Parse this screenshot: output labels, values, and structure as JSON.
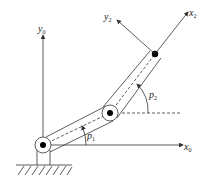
{
  "diagram": {
    "type": "two-link planar robot arm",
    "labels": {
      "y0": {
        "base": "y",
        "sub": "0"
      },
      "x0": {
        "base": "x",
        "sub": "0"
      },
      "y2": {
        "base": "y",
        "sub": "2"
      },
      "x2": {
        "base": "x",
        "sub": "2"
      },
      "p1": {
        "base": "p",
        "sub": "1"
      },
      "p2": {
        "base": "p",
        "sub": "2"
      }
    },
    "colors": {
      "line": "#333333",
      "joint_fill": "#000000",
      "background": "#ffffff"
    }
  }
}
